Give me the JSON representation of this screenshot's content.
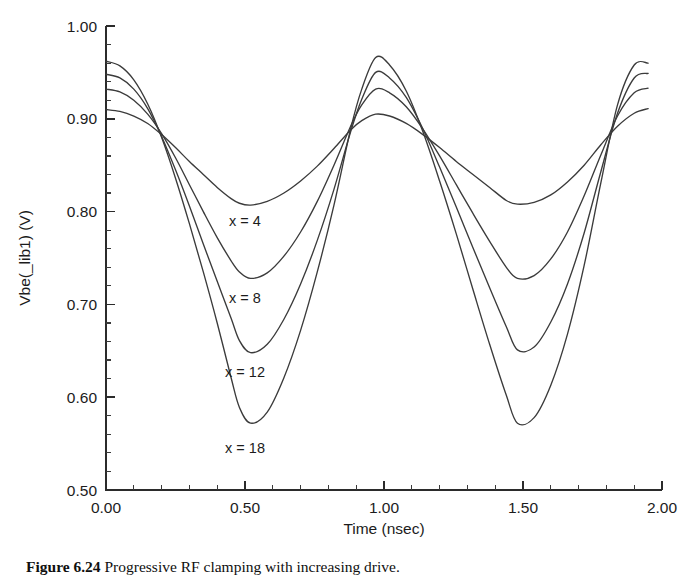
{
  "figure": {
    "caption_label": "Figure 6.24",
    "caption_text": "Progressive RF clamping with increasing drive.",
    "caption_full": "Figure 6.24   Progressive RF clamping with increasing drive."
  },
  "chart_data": {
    "type": "line",
    "title": "",
    "xlabel": "Time (nsec)",
    "ylabel": "Vbe(_lib1) (V)",
    "xlim": [
      0.0,
      2.0
    ],
    "ylim": [
      0.5,
      1.0
    ],
    "grid": false,
    "legend_position": "inline-annotations",
    "x_ticks_major": [
      "0.00",
      "0.50",
      "1.00",
      "1.50",
      "2.00"
    ],
    "x_ticks_major_values": [
      0.0,
      0.5,
      1.0,
      1.5,
      2.0
    ],
    "x_minor_per_major": 5,
    "y_ticks_major": [
      "0.50",
      "0.60",
      "0.70",
      "0.80",
      "0.90",
      "1.00"
    ],
    "y_ticks_major_values": [
      0.5,
      0.6,
      0.7,
      0.8,
      0.9,
      1.0
    ],
    "y_minor_per_major": 5,
    "annotations": [
      {
        "text": "x = 4",
        "x": 0.5,
        "y": 0.784
      },
      {
        "text": "x = 8",
        "x": 0.5,
        "y": 0.702
      },
      {
        "text": "x = 12",
        "x": 0.5,
        "y": 0.622
      },
      {
        "text": "x = 18",
        "x": 0.5,
        "y": 0.54
      }
    ],
    "series": [
      {
        "name": "x = 4",
        "drive": 4,
        "start_value": 0.91,
        "min_value": 0.807,
        "peak_value": 0.905,
        "end_value": 0.911,
        "x": [
          0.0,
          0.05,
          0.1,
          0.15,
          0.2,
          0.25,
          0.3,
          0.35,
          0.4,
          0.45,
          0.48,
          0.52,
          0.58,
          0.64,
          0.7,
          0.76,
          0.82,
          0.88,
          0.92,
          0.97,
          1.02,
          1.08,
          1.14,
          1.2,
          1.26,
          1.32,
          1.38,
          1.44,
          1.48,
          1.54,
          1.6,
          1.66,
          1.72,
          1.78,
          1.84,
          1.9,
          1.95
        ],
        "values": [
          0.91,
          0.908,
          0.903,
          0.895,
          0.883,
          0.869,
          0.854,
          0.84,
          0.826,
          0.814,
          0.809,
          0.807,
          0.811,
          0.82,
          0.833,
          0.849,
          0.868,
          0.888,
          0.898,
          0.905,
          0.903,
          0.895,
          0.883,
          0.869,
          0.854,
          0.84,
          0.826,
          0.812,
          0.808,
          0.81,
          0.818,
          0.832,
          0.85,
          0.872,
          0.892,
          0.906,
          0.911
        ]
      },
      {
        "name": "x = 8",
        "drive": 8,
        "start_value": 0.932,
        "min_value": 0.726,
        "peak_value": 0.932,
        "end_value": 0.933,
        "x": [
          0.0,
          0.05,
          0.1,
          0.15,
          0.2,
          0.25,
          0.3,
          0.35,
          0.4,
          0.45,
          0.48,
          0.52,
          0.58,
          0.64,
          0.7,
          0.76,
          0.82,
          0.88,
          0.92,
          0.97,
          1.02,
          1.08,
          1.14,
          1.2,
          1.26,
          1.32,
          1.38,
          1.44,
          1.48,
          1.54,
          1.6,
          1.66,
          1.72,
          1.78,
          1.84,
          1.9,
          1.95
        ],
        "values": [
          0.932,
          0.929,
          0.92,
          0.905,
          0.884,
          0.858,
          0.829,
          0.8,
          0.772,
          0.747,
          0.735,
          0.728,
          0.734,
          0.752,
          0.778,
          0.811,
          0.85,
          0.892,
          0.915,
          0.932,
          0.928,
          0.913,
          0.889,
          0.86,
          0.829,
          0.798,
          0.768,
          0.74,
          0.728,
          0.731,
          0.749,
          0.778,
          0.817,
          0.861,
          0.903,
          0.928,
          0.933
        ]
      },
      {
        "name": "x = 12",
        "drive": 12,
        "start_value": 0.948,
        "min_value": 0.645,
        "peak_value": 0.95,
        "end_value": 0.949,
        "x": [
          0.0,
          0.05,
          0.1,
          0.15,
          0.2,
          0.25,
          0.3,
          0.35,
          0.4,
          0.45,
          0.48,
          0.52,
          0.58,
          0.64,
          0.7,
          0.76,
          0.82,
          0.88,
          0.92,
          0.97,
          1.02,
          1.08,
          1.14,
          1.2,
          1.26,
          1.32,
          1.38,
          1.44,
          1.48,
          1.54,
          1.6,
          1.66,
          1.72,
          1.78,
          1.84,
          1.9,
          1.95
        ],
        "values": [
          0.948,
          0.944,
          0.932,
          0.911,
          0.881,
          0.845,
          0.806,
          0.765,
          0.725,
          0.685,
          0.661,
          0.648,
          0.657,
          0.684,
          0.722,
          0.769,
          0.824,
          0.886,
          0.921,
          0.95,
          0.944,
          0.923,
          0.889,
          0.848,
          0.805,
          0.761,
          0.718,
          0.676,
          0.651,
          0.654,
          0.681,
          0.722,
          0.777,
          0.843,
          0.906,
          0.944,
          0.949
        ]
      },
      {
        "name": "x = 18",
        "drive": 18,
        "start_value": 0.962,
        "min_value": 0.57,
        "peak_value": 0.966,
        "end_value": 0.96,
        "x": [
          0.0,
          0.05,
          0.1,
          0.15,
          0.2,
          0.25,
          0.3,
          0.35,
          0.4,
          0.45,
          0.48,
          0.52,
          0.58,
          0.64,
          0.7,
          0.76,
          0.82,
          0.88,
          0.92,
          0.97,
          1.02,
          1.08,
          1.14,
          1.2,
          1.26,
          1.32,
          1.38,
          1.44,
          1.48,
          1.54,
          1.6,
          1.66,
          1.72,
          1.78,
          1.84,
          1.9,
          1.95
        ],
        "values": [
          0.962,
          0.957,
          0.942,
          0.916,
          0.88,
          0.836,
          0.787,
          0.735,
          0.68,
          0.621,
          0.589,
          0.572,
          0.584,
          0.621,
          0.672,
          0.735,
          0.807,
          0.889,
          0.932,
          0.966,
          0.958,
          0.93,
          0.886,
          0.833,
          0.776,
          0.716,
          0.657,
          0.602,
          0.572,
          0.578,
          0.613,
          0.668,
          0.742,
          0.831,
          0.915,
          0.958,
          0.96
        ]
      }
    ]
  }
}
